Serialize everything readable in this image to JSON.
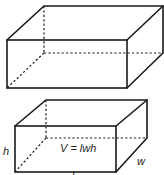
{
  "figure": {
    "top_box": {
      "description": "rectangular prism with hidden edges dashed"
    },
    "bottom_box": {
      "description": "rectangular prism labeled with dimensions",
      "labels": {
        "height": "h",
        "width": "w",
        "length": "l",
        "formula": "V = lwh"
      }
    }
  },
  "colors": {
    "line": "#1a1a1a",
    "background": "#ffffff"
  }
}
